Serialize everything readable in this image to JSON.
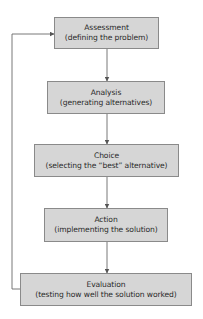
{
  "diagram": {
    "type": "flowchart",
    "colors": {
      "box_fill": "#d6d6d6",
      "box_border": "#8a8a8a",
      "line": "#6a6a6a",
      "text": "#2a2a2a"
    },
    "steps": [
      {
        "title": "Assessment",
        "subtitle": "(defining the problem)"
      },
      {
        "title": "Analysis",
        "subtitle": "(generating alternatives)"
      },
      {
        "title": "Choice",
        "subtitle": "(selecting the “best” alternative)"
      },
      {
        "title": "Action",
        "subtitle": "(implementing the solution)"
      },
      {
        "title": "Evaluation",
        "subtitle": "(testing how well the solution worked)"
      }
    ],
    "feedback_loop": {
      "from": "Evaluation",
      "to": "Assessment"
    }
  }
}
